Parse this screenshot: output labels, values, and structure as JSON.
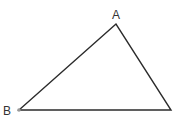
{
  "diagram": {
    "type": "triangle",
    "stroke_color": "#2b2b2b",
    "point_color": "#999999",
    "vertices": [
      {
        "id": "A",
        "label": "A",
        "x": 116,
        "y": 24,
        "label_x": 112,
        "label_y": 18
      },
      {
        "id": "B",
        "label": "B",
        "x": 19,
        "y": 110,
        "label_x": 3,
        "label_y": 115
      },
      {
        "id": "C",
        "label": "",
        "x": 171,
        "y": 110
      }
    ]
  }
}
